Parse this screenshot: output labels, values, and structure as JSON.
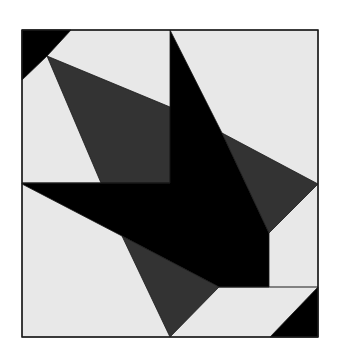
{
  "figure": {
    "colors": {
      "background": "#ffffff",
      "light": "#e8e8e8",
      "dark": "#333333",
      "black": "#000000",
      "border": "#1a1a1a"
    },
    "frame": {
      "x": 22,
      "y": 30,
      "width": 296,
      "height": 307
    },
    "dividers": {
      "vertical_x": 170,
      "horizontal_y": 183
    },
    "shapes": [
      {
        "name": "light-background",
        "fill": "light",
        "points": "22,30 318,30 318,337 22,337"
      },
      {
        "name": "top-left-black-corner",
        "fill": "black",
        "points": "22,30 71,30 47,56 22,80"
      },
      {
        "name": "upper-left-dark-triangle",
        "fill": "dark",
        "points": "47,56 170,107 170,183 101,183"
      },
      {
        "name": "central-black-star",
        "fill": "black",
        "points": "170,30 222,133 269,233 269,287 219,287 122,236 22,184 22,183 170,183"
      },
      {
        "name": "right-dark-triangle",
        "fill": "dark",
        "points": "222,133 318,184 269,233"
      },
      {
        "name": "lower-dark-triangle",
        "fill": "dark",
        "points": "122,236 219,287 170,337"
      },
      {
        "name": "bottom-right-black-corner",
        "fill": "black",
        "points": "318,287 318,337 270,337"
      }
    ],
    "lines": [
      {
        "name": "top-left-light-line-1",
        "points": "22,183 170,183"
      },
      {
        "name": "parallelogram-top-line",
        "points": "219,287 318,287"
      }
    ]
  }
}
